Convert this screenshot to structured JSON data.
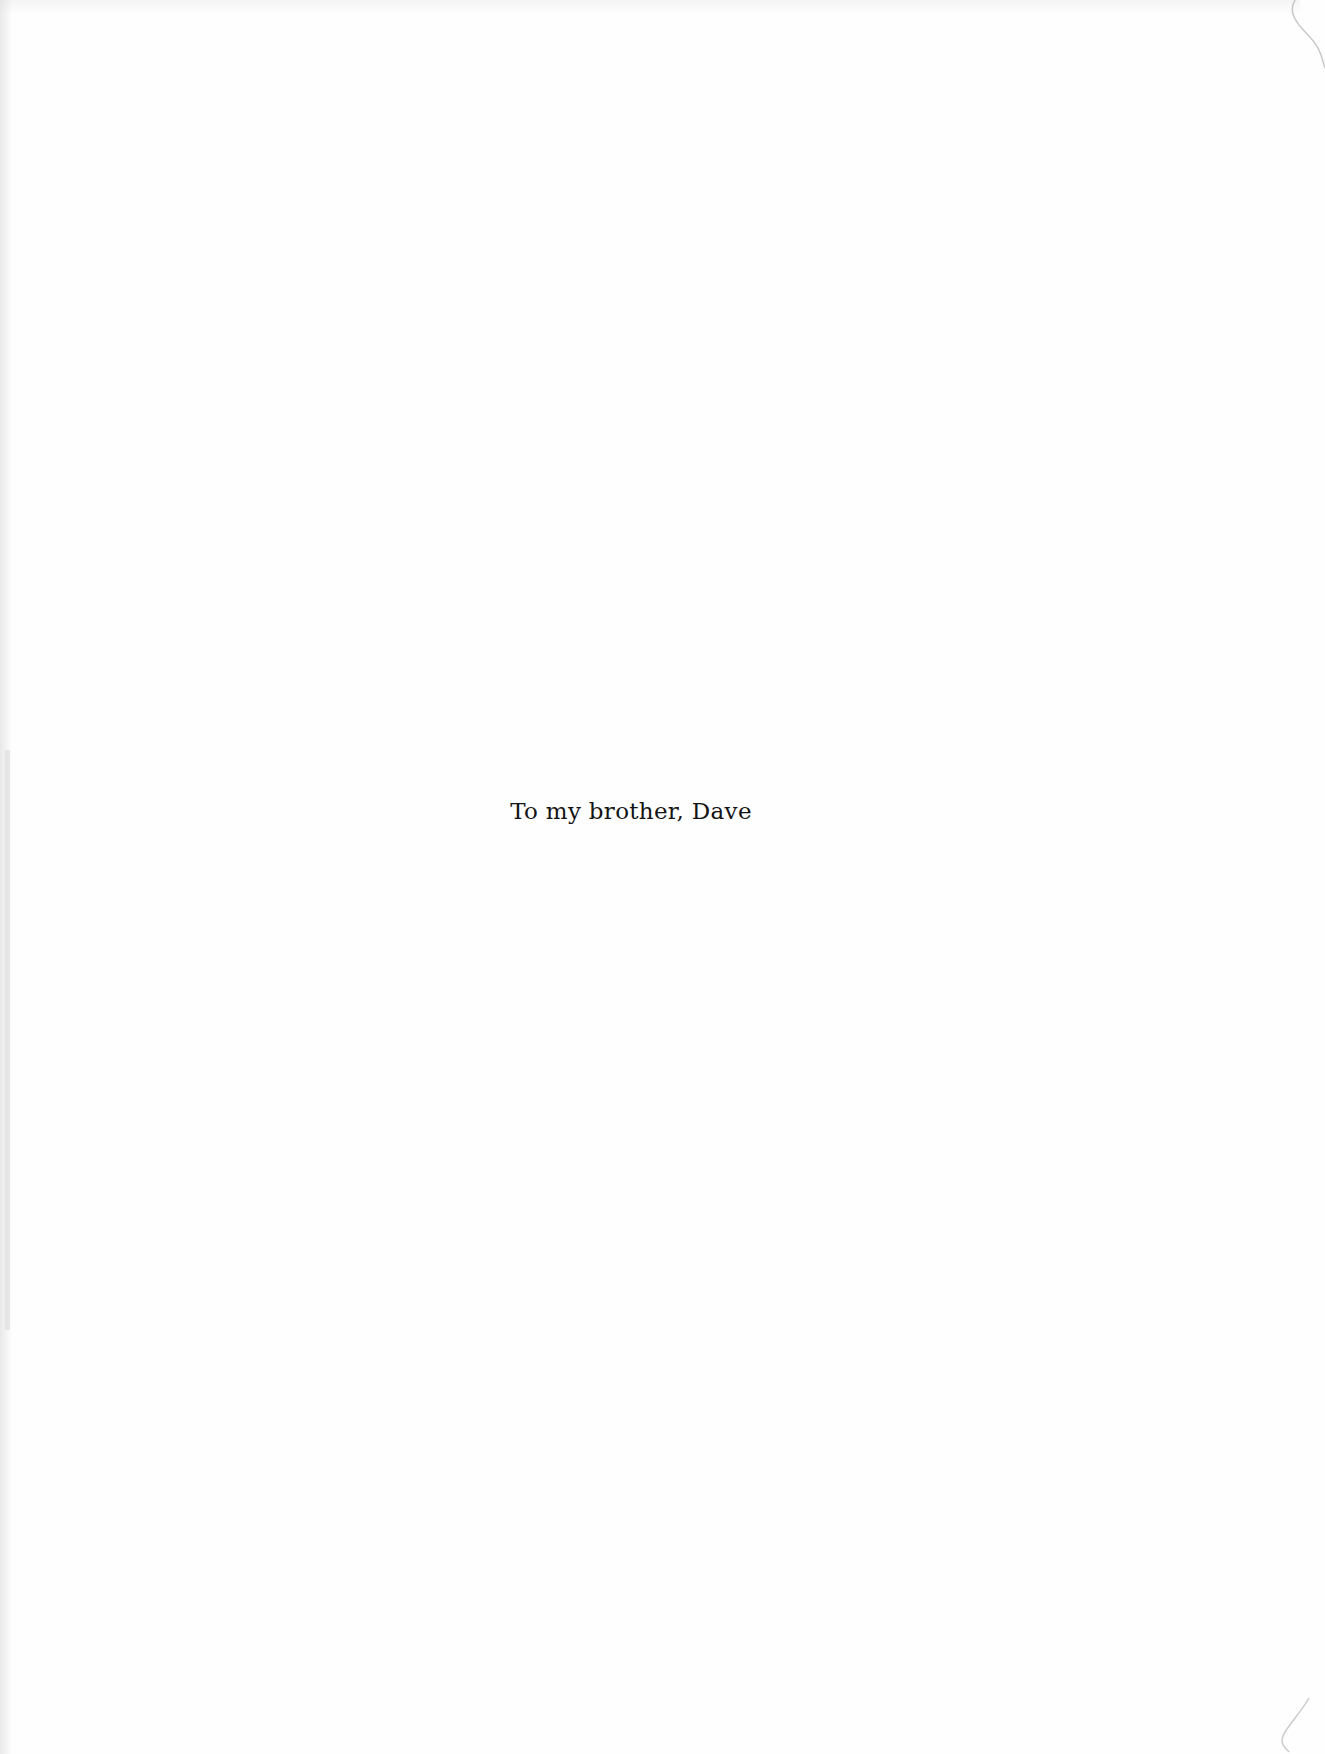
{
  "page": {
    "type": "dedication",
    "background_color": "#fefefe",
    "text_color": "#141414"
  },
  "dedication": {
    "text": "To my brother, Dave"
  }
}
